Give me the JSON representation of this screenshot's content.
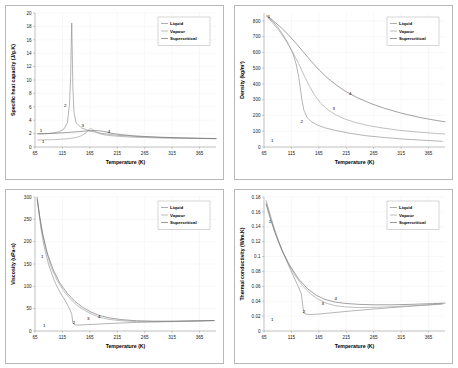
{
  "figure": {
    "background": "#ffffff",
    "border_color": "#b8b8b8",
    "panel_count": 4
  },
  "shared": {
    "xlabel": "Temperature (K)",
    "x_ticks": [
      65,
      115,
      165,
      215,
      265,
      315,
      365
    ],
    "xlim": [
      65,
      395
    ],
    "legend": {
      "position": "top-right",
      "entries": [
        "Liquid",
        "Vapour",
        "Supercritical"
      ]
    },
    "annotations": [
      "1",
      "2",
      "3",
      "4"
    ],
    "colors": {
      "liquid": "#8c8c8c",
      "vapour": "#9e9e9e",
      "supercritical": "#707070",
      "grid": "#e8e8e8",
      "axis": "#8a8a8a",
      "text": "#000000"
    }
  },
  "chart_data": [
    {
      "type": "line",
      "id": "specific-heat-capacity",
      "title": "",
      "xlabel": "Temperature (K)",
      "ylabel": "Specific heat capacity (J/g.K)",
      "xlim": [
        65,
        395
      ],
      "ylim": [
        0,
        20
      ],
      "x_ticks": [
        65,
        115,
        165,
        215,
        265,
        315,
        365
      ],
      "y_ticks": [
        0,
        2,
        4,
        6,
        8,
        10,
        12,
        14,
        16,
        18,
        20
      ],
      "grid": true,
      "legend": [
        "Liquid",
        "Vapour",
        "Supercritical"
      ],
      "annotations": [
        {
          "label": "1",
          "x": 76,
          "y": 2.2
        },
        {
          "label": "1",
          "x": 80,
          "y": 0.55
        },
        {
          "label": "2",
          "x": 120,
          "y": 5.9
        },
        {
          "label": "3",
          "x": 152,
          "y": 3.0
        },
        {
          "label": "4",
          "x": 200,
          "y": 2.1
        }
      ],
      "series": [
        {
          "name": "Liquid",
          "x": [
            70,
            80,
            90,
            100,
            110,
            118,
            124,
            128,
            130,
            131,
            132,
            133,
            134,
            136,
            140,
            150,
            165,
            185,
            215,
            255,
            305,
            355,
            395
          ],
          "y": [
            1.95,
            1.97,
            2.02,
            2.1,
            2.3,
            2.7,
            3.6,
            6.5,
            10.5,
            15.0,
            18.5,
            14.0,
            9.0,
            5.2,
            3.6,
            2.85,
            2.4,
            2.05,
            1.75,
            1.55,
            1.38,
            1.3,
            1.25
          ]
        },
        {
          "name": "Vapour",
          "x": [
            70,
            80,
            90,
            100,
            110,
            120,
            130,
            140,
            150,
            158,
            162,
            166,
            170,
            176,
            184,
            196,
            215,
            245,
            285,
            330,
            370,
            395
          ],
          "y": [
            1.05,
            1.06,
            1.08,
            1.1,
            1.15,
            1.2,
            1.28,
            1.42,
            1.7,
            2.1,
            2.5,
            2.75,
            2.6,
            2.25,
            1.95,
            1.75,
            1.6,
            1.46,
            1.36,
            1.3,
            1.26,
            1.24
          ]
        },
        {
          "name": "Supercritical",
          "x": [
            70,
            85,
            100,
            115,
            130,
            145,
            160,
            172,
            182,
            190,
            196,
            202,
            210,
            222,
            240,
            265,
            295,
            330,
            365,
            395
          ],
          "y": [
            1.98,
            2.0,
            2.05,
            2.12,
            2.2,
            2.3,
            2.4,
            2.45,
            2.42,
            2.33,
            2.22,
            2.1,
            1.98,
            1.84,
            1.7,
            1.57,
            1.46,
            1.37,
            1.3,
            1.26
          ]
        }
      ]
    },
    {
      "type": "line",
      "id": "density",
      "title": "",
      "xlabel": "Temperature (K)",
      "ylabel": "Density (kg/m³)",
      "xlim": [
        65,
        395
      ],
      "ylim": [
        0,
        850
      ],
      "x_ticks": [
        65,
        115,
        165,
        215,
        265,
        315,
        365
      ],
      "y_ticks": [
        0,
        100,
        200,
        300,
        400,
        500,
        600,
        700,
        800
      ],
      "grid": true,
      "legend": [
        "Liquid",
        "Vapour",
        "Supercritical"
      ],
      "annotations": [
        {
          "label": "1",
          "x": 74,
          "y": 818
        },
        {
          "label": "1",
          "x": 80,
          "y": 32
        },
        {
          "label": "2",
          "x": 134,
          "y": 152
        },
        {
          "label": "3",
          "x": 192,
          "y": 236
        },
        {
          "label": "4",
          "x": 222,
          "y": 330
        }
      ],
      "series": [
        {
          "name": "Liquid",
          "x": [
            70,
            80,
            90,
            100,
            110,
            118,
            124,
            128,
            131,
            134,
            138,
            144,
            152,
            162,
            176,
            195,
            220,
            250,
            285,
            320,
            355,
            390
          ],
          "y": [
            830,
            800,
            760,
            710,
            650,
            590,
            520,
            450,
            380,
            300,
            230,
            185,
            160,
            140,
            122,
            105,
            88,
            72,
            60,
            50,
            43,
            36
          ]
        },
        {
          "name": "Vapour",
          "x": [
            70,
            80,
            92,
            104,
            116,
            128,
            138,
            148,
            158,
            168,
            180,
            195,
            212,
            232,
            255,
            282,
            312,
            345,
            378,
            395
          ],
          "y": [
            830,
            790,
            740,
            680,
            610,
            530,
            455,
            385,
            325,
            280,
            240,
            205,
            178,
            155,
            136,
            120,
            106,
            95,
            86,
            82
          ]
        },
        {
          "name": "Supercritical",
          "x": [
            70,
            82,
            96,
            110,
            124,
            138,
            152,
            166,
            180,
            196,
            214,
            234,
            258,
            285,
            315,
            348,
            380,
            395
          ],
          "y": [
            835,
            800,
            758,
            710,
            655,
            598,
            540,
            487,
            440,
            395,
            352,
            315,
            278,
            245,
            215,
            188,
            168,
            160
          ]
        }
      ]
    },
    {
      "type": "line",
      "id": "viscosity",
      "title": "",
      "xlabel": "Temperature (K)",
      "ylabel": "Viscosity (uPa-s)",
      "xlim": [
        65,
        395
      ],
      "ylim": [
        0,
        300
      ],
      "x_ticks": [
        65,
        115,
        165,
        215,
        265,
        315,
        365
      ],
      "y_ticks": [
        0,
        50,
        100,
        150,
        200,
        250,
        300
      ],
      "grid": true,
      "legend": [
        "Liquid",
        "Vapour",
        "Supercritical"
      ],
      "annotations": [
        {
          "label": "1",
          "x": 78,
          "y": 163
        },
        {
          "label": "1",
          "x": 82,
          "y": 9
        },
        {
          "label": "2",
          "x": 136,
          "y": 16
        },
        {
          "label": "3",
          "x": 162,
          "y": 24
        },
        {
          "label": "4",
          "x": 182,
          "y": 30
        }
      ],
      "series": [
        {
          "name": "Liquid",
          "x": [
            69,
            72,
            76,
            82,
            90,
            100,
            110,
            120,
            128,
            132,
            134,
            138,
            146,
            160,
            180,
            210,
            250,
            295,
            340,
            390
          ],
          "y": [
            300,
            268,
            228,
            188,
            148,
            113,
            88,
            68,
            50,
            38,
            18,
            14,
            13.5,
            14.2,
            15.5,
            17.3,
            19.2,
            21,
            22.3,
            23.5
          ]
        },
        {
          "name": "Vapour",
          "x": [
            69,
            73,
            78,
            85,
            94,
            105,
            117,
            130,
            142,
            155,
            168,
            182,
            200,
            222,
            250,
            285,
            320,
            358,
            392
          ],
          "y": [
            297,
            262,
            222,
            182,
            144,
            114,
            90,
            71,
            57,
            46.5,
            38,
            31,
            26,
            23,
            21,
            20.5,
            21,
            22,
            23.2
          ]
        },
        {
          "name": "Supercritical",
          "x": [
            69,
            74,
            80,
            88,
            98,
            110,
            124,
            138,
            152,
            166,
            182,
            200,
            222,
            250,
            282,
            318,
            356,
            392
          ],
          "y": [
            294,
            252,
            212,
            172,
            138,
            108,
            84,
            66,
            53,
            43,
            35,
            29.5,
            25.5,
            23,
            22,
            22,
            22.6,
            23.4
          ]
        }
      ]
    },
    {
      "type": "line",
      "id": "thermal-conductivity",
      "title": "",
      "xlabel": "Temperature (K)",
      "ylabel": "Thermal conductivity (W/m.K)",
      "xlim": [
        65,
        395
      ],
      "ylim": [
        0,
        0.18
      ],
      "x_ticks": [
        65,
        115,
        165,
        215,
        265,
        315,
        365
      ],
      "y_ticks": [
        0,
        0.02,
        0.04,
        0.06,
        0.08,
        0.1,
        0.12,
        0.14,
        0.16,
        0.18
      ],
      "grid": true,
      "legend": [
        "Liquid",
        "Vapour",
        "Supercritical"
      ],
      "annotations": [
        {
          "label": "1",
          "x": 76,
          "y": 0.145
        },
        {
          "label": "1",
          "x": 80,
          "y": 0.013
        },
        {
          "label": "2",
          "x": 138,
          "y": 0.0245
        },
        {
          "label": "3",
          "x": 172,
          "y": 0.0345
        },
        {
          "label": "4",
          "x": 196,
          "y": 0.0415
        }
      ],
      "series": [
        {
          "name": "Liquid",
          "x": [
            69,
            74,
            82,
            92,
            104,
            116,
            126,
            133,
            136,
            138,
            142,
            150,
            165,
            190,
            225,
            265,
            305,
            345,
            390
          ],
          "y": [
            0.175,
            0.162,
            0.142,
            0.12,
            0.098,
            0.078,
            0.062,
            0.05,
            0.032,
            0.024,
            0.0225,
            0.0222,
            0.0228,
            0.0245,
            0.027,
            0.0295,
            0.0318,
            0.034,
            0.0365
          ]
        },
        {
          "name": "Vapour",
          "x": [
            69,
            75,
            84,
            95,
            108,
            122,
            136,
            150,
            164,
            178,
            195,
            215,
            240,
            270,
            305,
            345,
            390
          ],
          "y": [
            0.172,
            0.157,
            0.135,
            0.113,
            0.092,
            0.074,
            0.06,
            0.05,
            0.0425,
            0.0375,
            0.034,
            0.0322,
            0.0315,
            0.0318,
            0.0328,
            0.0342,
            0.036
          ]
        },
        {
          "name": "Supercritical",
          "x": [
            69,
            76,
            86,
            98,
            112,
            128,
            144,
            160,
            176,
            194,
            214,
            238,
            266,
            298,
            334,
            372,
            395
          ],
          "y": [
            0.17,
            0.152,
            0.13,
            0.108,
            0.088,
            0.07,
            0.057,
            0.048,
            0.0425,
            0.039,
            0.037,
            0.0358,
            0.0352,
            0.0352,
            0.0358,
            0.0368,
            0.0375
          ]
        }
      ]
    }
  ]
}
